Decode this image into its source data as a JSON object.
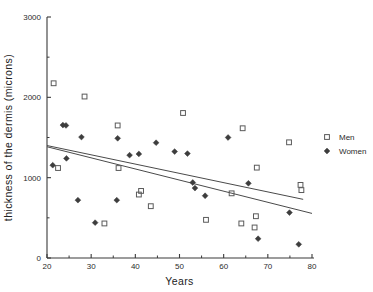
{
  "chart_data": {
    "type": "scatter",
    "title": "",
    "xlabel": "Years",
    "ylabel": "thickness of the dermis (microns)",
    "xlim": [
      20,
      80
    ],
    "ylim": [
      0,
      3000
    ],
    "grid": false,
    "x_ticks": [
      20,
      30,
      40,
      50,
      60,
      70,
      80
    ],
    "x_tick_labels": [
      "20",
      "30",
      "40",
      "50",
      "60",
      "70",
      "80"
    ],
    "x_minor_ticks": [
      25,
      35,
      45,
      55,
      65,
      75
    ],
    "y_ticks": [
      0,
      1000,
      2000,
      3000
    ],
    "y_tick_labels": [
      "0",
      "1000",
      "2000",
      "3000"
    ],
    "y_minor_ticks": [
      500,
      1500,
      2500
    ],
    "legend_position": "right",
    "series": [
      {
        "name": "Men",
        "marker": "open-square",
        "points": [
          [
            21.5,
            2175
          ],
          [
            22.5,
            1120
          ],
          [
            28.5,
            2010
          ],
          [
            33.0,
            430
          ],
          [
            36.0,
            1650
          ],
          [
            36.2,
            1120
          ],
          [
            40.8,
            790
          ],
          [
            41.3,
            835
          ],
          [
            43.5,
            645
          ],
          [
            50.8,
            1805
          ],
          [
            56.0,
            475
          ],
          [
            61.8,
            805
          ],
          [
            64.3,
            1615
          ],
          [
            64.0,
            430
          ],
          [
            67.0,
            380
          ],
          [
            67.3,
            520
          ],
          [
            67.5,
            1125
          ],
          [
            74.8,
            1440
          ],
          [
            77.4,
            910
          ],
          [
            77.6,
            845
          ]
        ]
      },
      {
        "name": "Women",
        "marker": "filled-diamond",
        "points": [
          [
            21.3,
            1155
          ],
          [
            23.6,
            1655
          ],
          [
            24.3,
            1650
          ],
          [
            24.4,
            1240
          ],
          [
            27.0,
            720
          ],
          [
            27.8,
            1505
          ],
          [
            30.9,
            440
          ],
          [
            35.8,
            720
          ],
          [
            36.0,
            1490
          ],
          [
            38.7,
            1280
          ],
          [
            40.8,
            1295
          ],
          [
            44.7,
            1435
          ],
          [
            48.9,
            1325
          ],
          [
            51.8,
            1300
          ],
          [
            53.0,
            940
          ],
          [
            53.5,
            870
          ],
          [
            55.8,
            775
          ],
          [
            61.0,
            1500
          ],
          [
            65.6,
            930
          ],
          [
            67.8,
            240
          ],
          [
            74.9,
            565
          ],
          [
            77.0,
            170
          ]
        ]
      }
    ],
    "fit_lines": [
      {
        "name": "Men",
        "x_start": 20.0,
        "y_start": 1400,
        "x_end": 78.0,
        "y_end": 730
      },
      {
        "name": "Women",
        "x_start": 20.0,
        "y_start": 1385,
        "x_end": 80.0,
        "y_end": 555
      }
    ]
  },
  "legend": {
    "items": [
      {
        "label": "Men",
        "marker": "open-square"
      },
      {
        "label": "Women",
        "marker": "filled-diamond"
      }
    ]
  },
  "axes": {
    "x_title": "Years",
    "y_title": "thickness of the dermis (microns)"
  }
}
